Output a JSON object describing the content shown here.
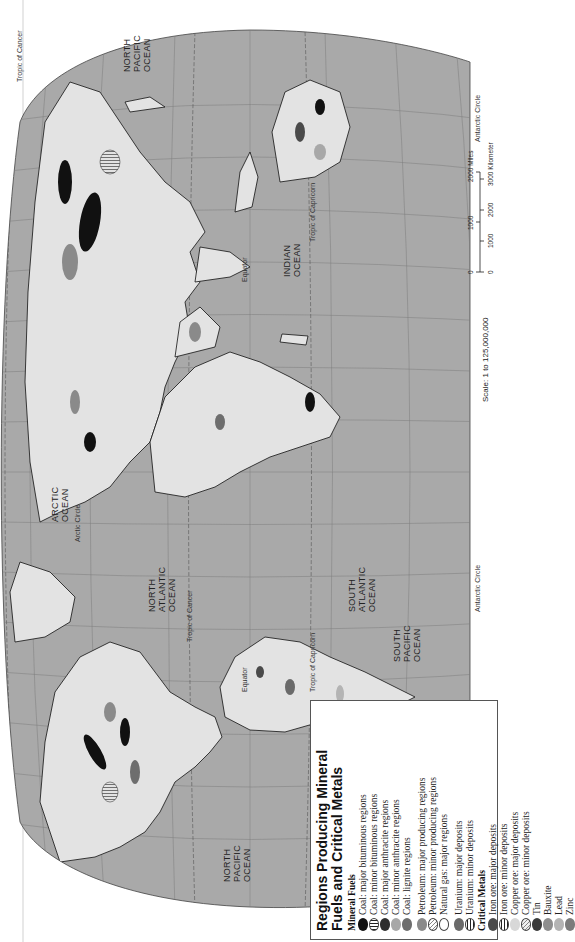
{
  "map": {
    "title_line1": "Regions Producing Mineral",
    "title_line2": "Fuels and Critical Metals",
    "colors": {
      "ocean": "#a9a9a9",
      "land": "#e3e3e3",
      "graticule": "#7a7a7a",
      "coastline": "#111111",
      "outside": "#ffffff"
    },
    "ocean_labels": [
      {
        "name": "NORTH PACIFIC OCEAN",
        "lines": [
          "NORTH",
          "PACIFIC",
          "OCEAN"
        ],
        "position": "west"
      },
      {
        "name": "NORTH ATLANTIC OCEAN",
        "lines": [
          "NORTH",
          "ATLANTIC",
          "OCEAN"
        ]
      },
      {
        "name": "ARCTIC OCEAN",
        "lines": [
          "ARCTIC",
          "OCEAN"
        ]
      },
      {
        "name": "SOUTH PACIFIC OCEAN",
        "lines": [
          "SOUTH",
          "PACIFIC",
          "OCEAN"
        ]
      },
      {
        "name": "SOUTH ATLANTIC OCEAN",
        "lines": [
          "SOUTH",
          "ATLANTIC",
          "OCEAN"
        ]
      },
      {
        "name": "INDIAN OCEAN",
        "lines": [
          "INDIAN",
          "OCEAN"
        ]
      },
      {
        "name": "NORTH PACIFIC OCEAN",
        "lines": [
          "NORTH",
          "PACIFIC",
          "OCEAN"
        ],
        "position": "east"
      }
    ],
    "reference_lines": {
      "equator": "Equator",
      "tropic_cancer": "Tropic of Cancer",
      "tropic_capricorn": "Tropic of Capricorn",
      "arctic_circle": "Arctic Circle",
      "antarctic_circle": "Antarctic Circle"
    },
    "longitude_labels": [
      "160°",
      "140°",
      "120°",
      "100°",
      "80°",
      "60°",
      "40°",
      "20°",
      "0°",
      "20°",
      "40°",
      "60°",
      "80°",
      "100°",
      "120°",
      "140°",
      "160°"
    ],
    "latitude_labels": [
      "80°",
      "60°",
      "40°",
      "20°",
      "20°",
      "40°",
      "60°",
      "80°"
    ]
  },
  "legend": {
    "title": "Regions Producing Mineral Fuels and Critical Metals",
    "sections": [
      {
        "heading": "Mineral Fuels",
        "groups": [
          [
            {
              "label": "Coal: major bituminous regions",
              "swatch": "#111111",
              "pattern": "solid"
            },
            {
              "label": "Coal: minor bituminous regions",
              "swatch": "#ffffff",
              "pattern": "vertical-lines"
            },
            {
              "label": "Coal: major anthracite regions",
              "swatch": "#2e2e2e",
              "pattern": "solid"
            },
            {
              "label": "Coal: minor anthracite regions",
              "swatch": "#a8a8a8",
              "pattern": "solid"
            },
            {
              "label": "Coal: lignite regions",
              "swatch": "#6e6e6e",
              "pattern": "solid"
            }
          ],
          [
            {
              "label": "Petroleum: major producing regions",
              "swatch": "#8a8a8a",
              "pattern": "solid"
            },
            {
              "label": "Petroleum: minor producing regions",
              "swatch": "#ffffff",
              "pattern": "diagonal-lines"
            },
            {
              "label": "Natural gas: major regions",
              "swatch": "#ffffff",
              "pattern": "outline"
            }
          ],
          [
            {
              "label": "Uranium: major deposits",
              "swatch": "#6a6a6a",
              "pattern": "solid"
            },
            {
              "label": "Uranium: minor deposits",
              "swatch": "#ffffff",
              "pattern": "horizontal-lines"
            }
          ]
        ]
      },
      {
        "heading": "Critical Metals",
        "groups": [
          [
            {
              "label": "Iron ore: major deposits",
              "swatch": "#4a4a4a",
              "pattern": "solid"
            },
            {
              "label": "Iron ore: minor deposits",
              "swatch": "#ffffff",
              "pattern": "horizontal-lines"
            },
            {
              "label": "Copper ore: major deposits",
              "swatch": "#d8d8d8",
              "pattern": "solid"
            },
            {
              "label": "Copper ore: minor deposits",
              "swatch": "#f0f0f0",
              "pattern": "diagonal-lines"
            },
            {
              "label": "Tin",
              "swatch": "#3a3a3a",
              "pattern": "solid"
            },
            {
              "label": "Bauxite",
              "swatch": "#8e8e8e",
              "pattern": "solid"
            },
            {
              "label": "Lead",
              "swatch": "#b4b4b4",
              "pattern": "solid"
            },
            {
              "label": "Zinc",
              "swatch": "#7c7c7c",
              "pattern": "solid"
            }
          ]
        ]
      }
    ]
  },
  "scale": {
    "text": "Scale: 1 to 125,000,000",
    "miles_ticks": [
      "0",
      "1000",
      "2000 Miles"
    ],
    "km_ticks": [
      "0",
      "1000",
      "2000",
      "3000 Kilometers"
    ]
  }
}
